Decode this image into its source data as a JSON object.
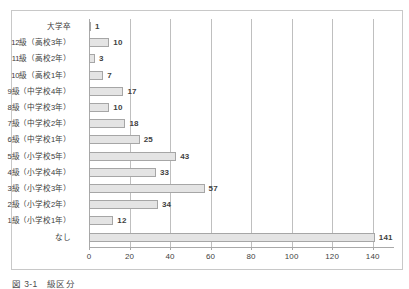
{
  "figure": {
    "caption": "図 3-1　級区分",
    "background_color": "#ffffff",
    "border_color": "#c8c8c8"
  },
  "chart_data": {
    "type": "bar",
    "orientation": "horizontal",
    "title": "",
    "xlabel": "",
    "ylabel": "",
    "xlim": [
      0,
      150
    ],
    "ylim": null,
    "grid": "vertical-only",
    "legend": "none",
    "bar_color": "#e4e4e4",
    "bar_border_color": "#a6a6a6",
    "axis_color": "#a9a9a9",
    "gridline_color": "#bfbfbf",
    "xticks": [
      0,
      20,
      40,
      60,
      80,
      100,
      120,
      140
    ],
    "xtick_labels": [
      "0",
      "20",
      "40",
      "60",
      "80",
      "100",
      "120",
      "140"
    ],
    "categories": [
      "大学卒",
      "12級（高校3年）",
      "11級（高校2年）",
      "10級（高校1年）",
      "9級（中学校4年）",
      "8級（中学校3年）",
      "7級（中学校2年）",
      "6級（中学校1年）",
      "5級（小学校5年）",
      "4級（小学校4年）",
      "3級（小学校3年）",
      "2級（小学校2年）",
      "1級（小学校1年）",
      "なし"
    ],
    "values": [
      1,
      10,
      3,
      7,
      17,
      10,
      18,
      25,
      43,
      33,
      34,
      57,
      12,
      141
    ],
    "data_labels": [
      "1",
      "10",
      "3",
      "7",
      "17",
      "10",
      "18",
      "25",
      "43",
      "33",
      "57",
      "34",
      "12",
      "141"
    ]
  },
  "rows": [
    {
      "label": "大学卒",
      "value": 1,
      "value_label": "1"
    },
    {
      "label": "12級（高校3年）",
      "value": 10,
      "value_label": "10"
    },
    {
      "label": "11級（高校2年）",
      "value": 3,
      "value_label": "3"
    },
    {
      "label": "10級（高校1年）",
      "value": 7,
      "value_label": "7"
    },
    {
      "label": "9級（中学校4年）",
      "value": 17,
      "value_label": "17"
    },
    {
      "label": "8級（中学校3年）",
      "value": 10,
      "value_label": "10"
    },
    {
      "label": "7級（中学校2年）",
      "value": 18,
      "value_label": "18"
    },
    {
      "label": "6級（中学校1年）",
      "value": 25,
      "value_label": "25"
    },
    {
      "label": "5級（小学校5年）",
      "value": 43,
      "value_label": "43"
    },
    {
      "label": "4級（小学校4年）",
      "value": 33,
      "value_label": "33"
    },
    {
      "label": "3級（小学校3年）",
      "value": 57,
      "value_label": "57"
    },
    {
      "label": "2級（小学校2年）",
      "value": 34,
      "value_label": "34"
    },
    {
      "label": "1級（小学校1年）",
      "value": 12,
      "value_label": "12"
    },
    {
      "label": "なし",
      "value": 141,
      "value_label": "141"
    }
  ]
}
